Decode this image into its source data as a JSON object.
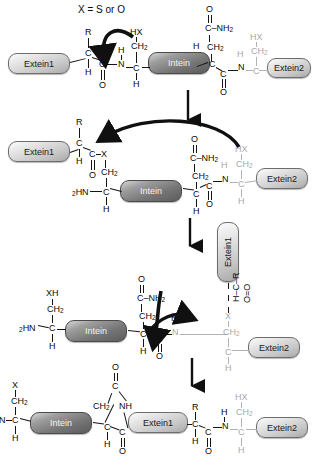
{
  "figure": {
    "type": "reaction-mechanism-diagram",
    "caption_note": "X = S or O"
  },
  "labels": {
    "x_definition": "X = S or O",
    "extein1": "Extein1",
    "extein2": "Extein2",
    "intein": "Intein",
    "C": "C",
    "H": "H",
    "N": "N",
    "O": "O",
    "R": "R",
    "X": "X",
    "HX": "HX",
    "XH": "XH",
    "CH2": "CH",
    "CH2_sub": "2",
    "NH2": "NH",
    "NH2_sub": "2",
    "C_NH2": "C–NH",
    "HN2": "HN",
    "HN2_sub": "2",
    "NH": "NH",
    "CO": "C=O",
    "HCR": "H–C–R",
    "CX": "C–X",
    "OeqO": "O=O"
  },
  "steps": [
    {
      "id": "step1",
      "name": "precursor",
      "description": "Linear precursor: Extein1-Intein-Extein2 with N-terminal Cys/Ser of intein and C-terminal Asn plus Cys/Ser of Extein2",
      "boxes": [
        "Extein1",
        "Intein",
        "Extein2"
      ],
      "atoms": [
        "X = S or O",
        "R",
        "C",
        "H",
        "O",
        "N",
        "HX",
        "CH2",
        "C-NH2",
        "Extein2"
      ]
    },
    {
      "id": "step2",
      "name": "n-s-acyl-shift",
      "description": "N-to-S (or N-to-O) acyl shift forms a linear thioester/ester at the N-terminal splice junction",
      "boxes": [
        "Extein1",
        "Intein",
        "Extein2"
      ],
      "atoms": [
        "R",
        "C",
        "H",
        "C-X",
        "O",
        "CH2",
        "2HN",
        "C-NH2",
        "N",
        "HX"
      ]
    },
    {
      "id": "step3",
      "name": "transesterification",
      "description": "Transesterification: the Extein1 acyl group is transferred to the Extein2 side chain forming a branched intermediate",
      "boxes": [
        "Extein1",
        "Intein",
        "Extein2"
      ],
      "atoms": [
        "XH",
        "CH2",
        "2HN",
        "C-NH2",
        "C",
        "H",
        "O",
        "N",
        "X",
        "H-C-R",
        "C=O"
      ]
    },
    {
      "id": "step4",
      "name": "asn-cyclization-product",
      "description": "Asparagine cyclization releases the intein as a succinimide and the ligated Extein1-Extein2 product",
      "boxes": [
        "Intein",
        "Extein1",
        "Extein2"
      ],
      "atoms": [
        "X",
        "CH2",
        "N",
        "C",
        "H",
        "O",
        "NH",
        "R",
        "HX"
      ]
    }
  ],
  "arrows": {
    "reaction_arrows": 3,
    "curved_electron_arrows": 4,
    "color": "#101010"
  },
  "colors": {
    "ink": "#101010",
    "grey_atom": "#a8a8a8",
    "box_light": "#dcdcdc",
    "box_dark": "#7a7a7a",
    "background": "#ffffff"
  }
}
